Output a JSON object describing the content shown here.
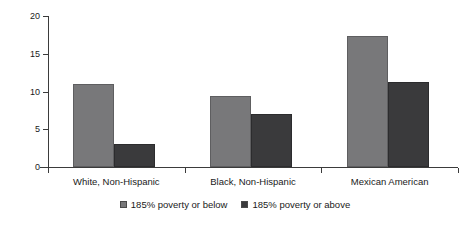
{
  "chart_data": {
    "type": "bar",
    "title": "",
    "xlabel": "",
    "ylabel": "Prevalence (%)",
    "ylim": [
      0,
      20
    ],
    "yticks": [
      0,
      5,
      10,
      15,
      20
    ],
    "ytick_labels": [
      "0",
      "5",
      "10",
      "15",
      "20"
    ],
    "grid": false,
    "legend_position": "bottom-center",
    "categories": [
      "White, Non-Hispanic",
      "Black, Non-Hispanic",
      "Mexican American"
    ],
    "series": [
      {
        "name": "185% poverty or below",
        "color": "#78787a",
        "values": [
          11.0,
          9.4,
          17.3
        ]
      },
      {
        "name": "185% poverty or above",
        "color": "#3a3a3c",
        "values": [
          3.1,
          7.0,
          11.2
        ]
      }
    ]
  },
  "axis": {
    "y_label": "Prevalence (%)"
  },
  "legend": {
    "items": [
      {
        "label": "185% poverty or below"
      },
      {
        "label": "185% poverty or above"
      }
    ]
  }
}
